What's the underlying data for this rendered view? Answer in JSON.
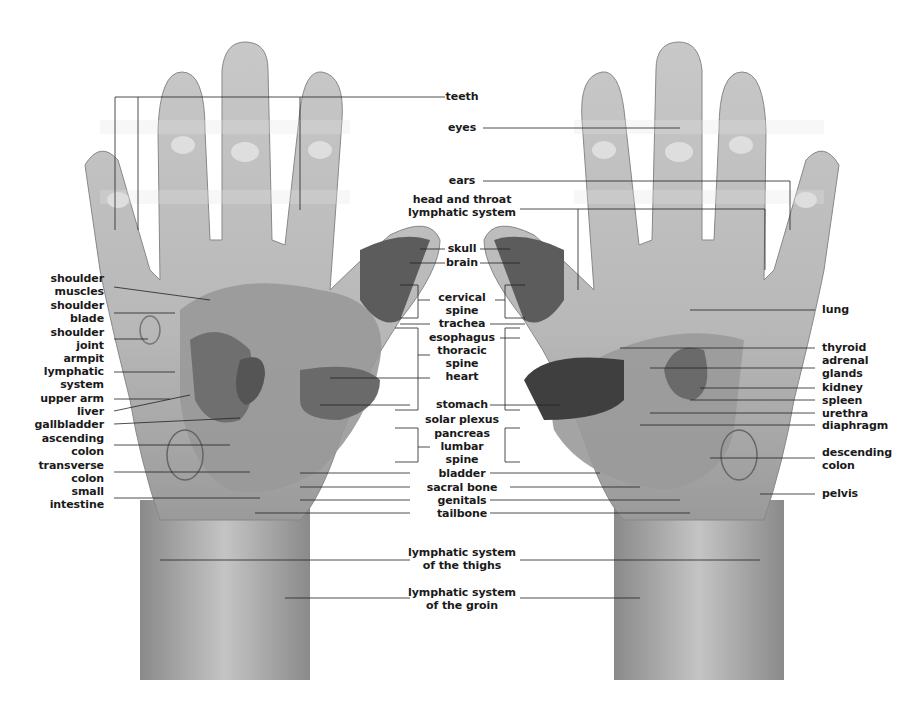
{
  "left_labels": [
    {
      "id": "shoulder-muscles",
      "text": "shoulder\nmuscles",
      "x": 108,
      "y": 272
    },
    {
      "id": "shoulder-blade",
      "text": "shoulder\nblade",
      "x": 108,
      "y": 299
    },
    {
      "id": "shoulder-joint",
      "text": "shoulder\njoint",
      "x": 108,
      "y": 326
    },
    {
      "id": "armpit-lymphatic-system",
      "text": "armpit\nlymphatic\nsystem",
      "x": 108,
      "y": 352
    },
    {
      "id": "upper-arm",
      "text": "upper arm",
      "x": 108,
      "y": 392
    },
    {
      "id": "liver",
      "text": "liver",
      "x": 108,
      "y": 405
    },
    {
      "id": "gallbladder",
      "text": "gallbladder",
      "x": 108,
      "y": 418
    },
    {
      "id": "ascending-colon",
      "text": "ascending\ncolon",
      "x": 108,
      "y": 432
    },
    {
      "id": "transverse-colon",
      "text": "transverse\ncolon",
      "x": 108,
      "y": 459
    },
    {
      "id": "small-intestine",
      "text": "small\nintestine",
      "x": 108,
      "y": 485
    }
  ],
  "center_labels": [
    {
      "id": "teeth",
      "text": "teeth",
      "y": 90
    },
    {
      "id": "eyes",
      "text": "eyes",
      "y": 121
    },
    {
      "id": "ears",
      "text": "ears",
      "y": 174
    },
    {
      "id": "head-and-throat-lymphatic-system",
      "text": "head and throat\nlymphatic system",
      "y": 193
    },
    {
      "id": "skull",
      "text": "skull",
      "y": 242
    },
    {
      "id": "brain",
      "text": "brain",
      "y": 256
    },
    {
      "id": "cervical-spine",
      "text": "cervical\nspine",
      "y": 291
    },
    {
      "id": "trachea",
      "text": "trachea",
      "y": 317
    },
    {
      "id": "esophagus",
      "text": "esophagus",
      "y": 331
    },
    {
      "id": "thoracic-spine",
      "text": "thoracic\nspine",
      "y": 344
    },
    {
      "id": "heart",
      "text": "heart",
      "y": 370
    },
    {
      "id": "stomach",
      "text": "stomach",
      "y": 398
    },
    {
      "id": "solar-plexus",
      "text": "solar plexus",
      "y": 413
    },
    {
      "id": "pancreas",
      "text": "pancreas",
      "y": 427
    },
    {
      "id": "lumbar-spine",
      "text": "lumbar\nspine",
      "y": 440
    },
    {
      "id": "bladder",
      "text": "bladder",
      "y": 467
    },
    {
      "id": "sacral-bone",
      "text": "sacral bone",
      "y": 481
    },
    {
      "id": "genitals",
      "text": "genitals",
      "y": 494
    },
    {
      "id": "tailbone",
      "text": "tailbone",
      "y": 507
    },
    {
      "id": "lymphatic-system-of-the-thighs",
      "text": "lymphatic system\nof the thighs",
      "y": 546
    },
    {
      "id": "lymphatic-system-of-the-groin",
      "text": "lymphatic system\nof the groin",
      "y": 586
    }
  ],
  "right_labels": [
    {
      "id": "lung",
      "text": "lung",
      "x": 822,
      "y": 303
    },
    {
      "id": "thyroid",
      "text": "thyroid",
      "x": 822,
      "y": 341
    },
    {
      "id": "adrenal-glands",
      "text": "adrenal\nglands",
      "x": 822,
      "y": 354
    },
    {
      "id": "kidney",
      "text": "kidney",
      "x": 822,
      "y": 381
    },
    {
      "id": "spleen",
      "text": "spleen",
      "x": 822,
      "y": 394
    },
    {
      "id": "urethra",
      "text": "urethra",
      "x": 822,
      "y": 407
    },
    {
      "id": "diaphragm",
      "text": "diaphragm",
      "x": 822,
      "y": 419
    },
    {
      "id": "descending-colon",
      "text": "descending\ncolon",
      "x": 822,
      "y": 446
    },
    {
      "id": "pelvis",
      "text": "pelvis",
      "x": 822,
      "y": 487
    }
  ],
  "colors": {
    "skin_light": "#d9d9d9",
    "skin_mid": "#b5b5b5",
    "organ_dark": "#6e6e6e",
    "organ_mid": "#8f8f8f",
    "thumb_dark": "#5a5a5a",
    "line": "#222222",
    "text": "#1a1a1a"
  }
}
